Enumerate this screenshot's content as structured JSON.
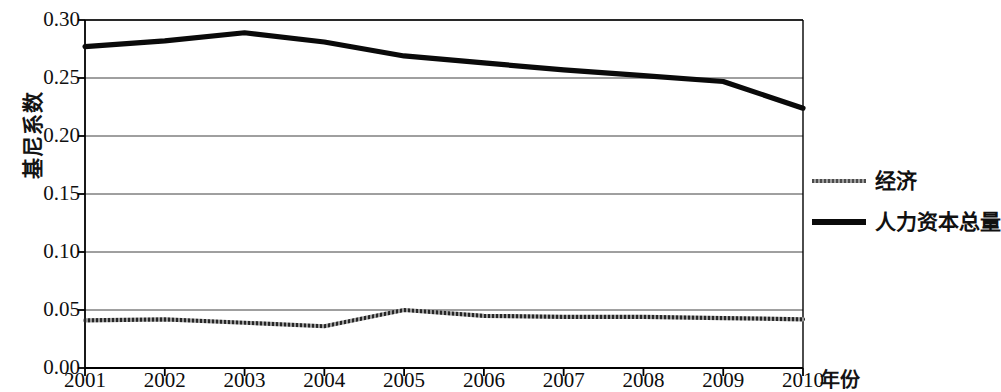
{
  "chart_data": {
    "type": "line",
    "title": "",
    "xlabel": "年份",
    "ylabel": "基尼系数",
    "x": [
      2001,
      2002,
      2003,
      2004,
      2005,
      2006,
      2007,
      2008,
      2009,
      2010
    ],
    "categories": [
      "2001",
      "2002",
      "2003",
      "2004",
      "2005",
      "2006",
      "2007",
      "2008",
      "2009",
      "2010"
    ],
    "y_ticks": [
      "0.00",
      "0.05",
      "0.10",
      "0.15",
      "0.20",
      "0.25",
      "0.30"
    ],
    "y_tick_values": [
      0.0,
      0.05,
      0.1,
      0.15,
      0.2,
      0.25,
      0.3
    ],
    "ylim": [
      0.0,
      0.3
    ],
    "xlim": [
      2001,
      2010
    ],
    "grid": "horizontal",
    "legend_position": "right",
    "series": [
      {
        "name": "经济",
        "style": "thin-textured-gray",
        "color": "#4a4a4a",
        "values": [
          0.041,
          0.042,
          0.039,
          0.036,
          0.05,
          0.045,
          0.044,
          0.044,
          0.043,
          0.042
        ]
      },
      {
        "name": "人力资本总量",
        "style": "thick-black",
        "color": "#0a0a0a",
        "values": [
          0.277,
          0.282,
          0.289,
          0.281,
          0.269,
          0.263,
          0.257,
          0.252,
          0.247,
          0.224
        ]
      }
    ]
  },
  "axis": {
    "y_title": "基尼系数",
    "x_title": "年份"
  },
  "legend": {
    "items": [
      {
        "label": "经济",
        "swatch": "thin-line-swatch"
      },
      {
        "label": "人力资本总量",
        "swatch": "thick-line-swatch"
      }
    ]
  }
}
